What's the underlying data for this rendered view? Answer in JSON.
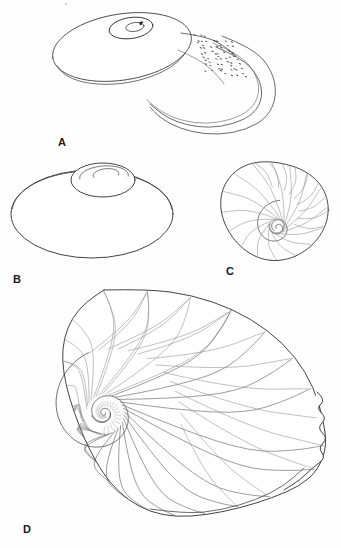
{
  "plate": {
    "width": 341,
    "height": 548,
    "background_color": "#fefefe",
    "ink_color": "#2e2e2e",
    "detail_color": "#8c8c8c",
    "subject": "gastropod shell",
    "style": "scientific line illustration",
    "figure_count": 4
  },
  "figures": [
    {
      "id": "A",
      "label": "A",
      "label_x": 58,
      "label_y": 146,
      "view": "oblique dorsal view with aperture",
      "center_x": 163,
      "center_y": 62,
      "bbox": [
        53,
        8,
        280,
        140
      ],
      "features": {
        "body_whorl": true,
        "aperture": true,
        "reflected_lip": true,
        "stippled_lip_patch": true,
        "protoconch": true,
        "radial_growth_lines": 26
      },
      "spire": {
        "cx": 131,
        "cy": 28,
        "rx": 22,
        "ry": 10.5
      },
      "dome": {
        "cx": 122,
        "cy": 47,
        "rx": 70,
        "ry": 33,
        "rot": -9
      },
      "nucleus": {
        "cx": 141,
        "cy": 24,
        "r": 3.2
      },
      "stipple_rows": 9,
      "stipple_per_row": 7
    },
    {
      "id": "B",
      "label": "B",
      "label_x": 13,
      "label_y": 283,
      "view": "oblique lateral view, low spire",
      "center_x": 92,
      "center_y": 215,
      "bbox": [
        10,
        158,
        175,
        260
      ],
      "features": {
        "elevated_spire": true,
        "body_whorl": true,
        "sinuous_growth_lines": 14,
        "suture": true
      },
      "spire": {
        "cx": 103,
        "cy": 180,
        "rx": 32,
        "ry": 17
      },
      "dome": {
        "cx": 92,
        "cy": 214,
        "rx": 81,
        "ry": 44
      }
    },
    {
      "id": "C",
      "label": "C",
      "label_x": 226,
      "label_y": 275,
      "view": "umbilical (basal) view",
      "center_x": 275,
      "center_y": 212,
      "bbox": [
        222,
        152,
        318,
        268
      ],
      "features": {
        "umbilicus": true,
        "spiral_coil": true,
        "growth_lines": 16,
        "whorl_count": 2.5
      },
      "body": {
        "cx": 274,
        "cy": 210,
        "r": 52
      },
      "umbilicus_center": {
        "cx": 277,
        "cy": 227
      }
    },
    {
      "id": "D",
      "label": "D",
      "label_x": 23,
      "label_y": 533,
      "view": "apertural / lateral view, enlarged",
      "center_x": 170,
      "center_y": 410,
      "bbox": [
        18,
        288,
        330,
        520
      ],
      "features": {
        "spiral_nucleus": true,
        "coarse_growth_lines": 34,
        "crenulated_aperture_margin": true,
        "whorl_count": 3
      },
      "spiral_center": {
        "cx": 104,
        "cy": 413
      },
      "outer_radius": 130
    }
  ],
  "labels": {
    "a": "A",
    "b": "B",
    "c": "C",
    "d": "D"
  }
}
